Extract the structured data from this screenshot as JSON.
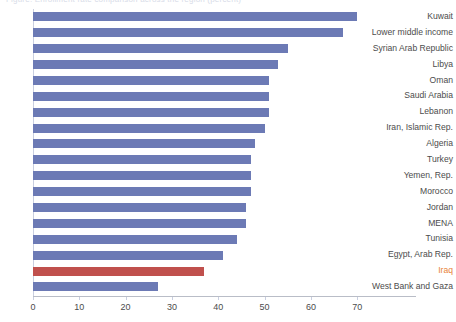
{
  "title": {
    "text": "Figure: Enrollment rate comparison across the region (percent)",
    "visible_clipped": true
  },
  "axis": {
    "x_ticks": [
      0,
      10,
      20,
      30,
      40,
      50,
      60,
      70
    ],
    "x_min": 0,
    "x_max": 76,
    "x_label": "",
    "y_label": ""
  },
  "colors": {
    "bar_default": "#6c7ab5",
    "bar_highlight": "#c0504d",
    "label_default": "#4c4c4c",
    "label_highlight": "#e8833a",
    "axis": "#b9bdc7"
  },
  "chart_data": {
    "type": "bar",
    "orientation": "horizontal",
    "title": "",
    "xlabel": "",
    "ylabel": "",
    "xlim": [
      0,
      76
    ],
    "grid": false,
    "legend": "none",
    "highlight_category": "Iraq",
    "categories": [
      "Kuwait",
      "Lower middle income",
      "Syrian Arab Republic",
      "Libya",
      "Oman",
      "Saudi Arabia",
      "Lebanon",
      "Iran, Islamic Rep.",
      "Algeria",
      "Turkey",
      "Yemen, Rep.",
      "Morocco",
      "Jordan",
      "MENA",
      "Tunisia",
      "Egypt, Arab Rep.",
      "Iraq",
      "West Bank and Gaza"
    ],
    "values": [
      70,
      67,
      55,
      53,
      51,
      51,
      51,
      50,
      48,
      47,
      47,
      47,
      46,
      46,
      44,
      41,
      37,
      27
    ]
  }
}
